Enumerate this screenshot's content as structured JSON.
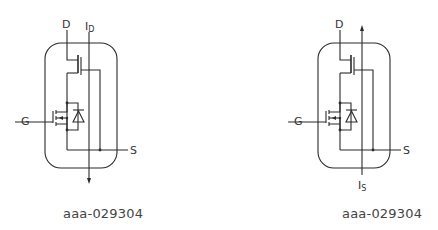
{
  "diagrams": [
    {
      "id": "left",
      "labels": {
        "drain": "D",
        "gate": "G",
        "source": "S",
        "current_main": "I",
        "current_sub": "D"
      },
      "current_direction": "down",
      "caption": "aaa-029304"
    },
    {
      "id": "right",
      "labels": {
        "drain": "D",
        "gate": "G",
        "source": "S",
        "current_main": "I",
        "current_sub": "S"
      },
      "current_direction": "up",
      "caption": "aaa-029304"
    }
  ],
  "colors": {
    "stroke": "#2a2a2a",
    "text": "#333333"
  }
}
